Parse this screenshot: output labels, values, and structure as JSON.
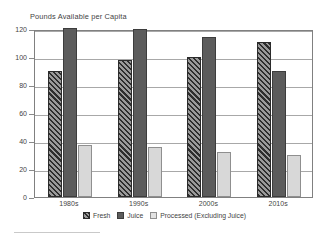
{
  "chart_data": {
    "type": "bar",
    "title": "Pounds Available per Capita",
    "subtitle": "",
    "xlabel": "",
    "ylabel": "",
    "categories": [
      "1980s",
      "1990s",
      "2000s",
      "2010s"
    ],
    "series": [
      {
        "name": "Fresh",
        "values": [
          90,
          98,
          100,
          111
        ],
        "color": "#6b6b6b",
        "pattern": "diagonal-hatch"
      },
      {
        "name": "Juice",
        "values": [
          121,
          120,
          114,
          90
        ],
        "color": "#5c5c5c",
        "pattern": "solid"
      },
      {
        "name": "Processed (Excluding Juice)",
        "values": [
          37,
          36,
          32,
          30
        ],
        "color": "#d8d8d8",
        "pattern": "solid"
      }
    ],
    "ylim": [
      0,
      120
    ],
    "yticks": [
      0,
      20,
      40,
      60,
      80,
      100,
      120
    ],
    "ytick_labels": [
      "0",
      "20",
      "40",
      "60",
      "80",
      "100",
      "120"
    ],
    "grid": true,
    "grid_axis": "y",
    "legend_position": "bottom"
  },
  "axes": {
    "y_ticks": [
      {
        "value": 0,
        "label": "0"
      },
      {
        "value": 20,
        "label": "20"
      },
      {
        "value": 40,
        "label": "40"
      },
      {
        "value": 60,
        "label": "60"
      },
      {
        "value": 80,
        "label": "80"
      },
      {
        "value": 100,
        "label": "100"
      },
      {
        "value": 120,
        "label": "120"
      }
    ],
    "x_ticks": [
      {
        "label": "1980s"
      },
      {
        "label": "1990s"
      },
      {
        "label": "2000s"
      },
      {
        "label": "2010s"
      }
    ]
  },
  "legend": {
    "items": [
      {
        "label": "Fresh"
      },
      {
        "label": "Juice"
      },
      {
        "label": "Processed (Excluding Juice)"
      }
    ]
  }
}
